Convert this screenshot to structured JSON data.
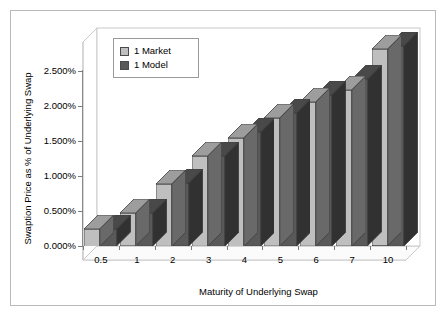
{
  "figure": {
    "border_color": "#b9b9b9",
    "background": "#ffffff"
  },
  "legend": {
    "position": "top-left-inside",
    "entries": [
      {
        "label": "1 Market",
        "color": "#bfbfbf",
        "swatch_name": "legend-swatch-market"
      },
      {
        "label": "1 Model",
        "color": "#595959",
        "swatch_name": "legend-swatch-model"
      }
    ]
  },
  "axes": {
    "y_title": "Swaption Price as % of Underlying Swap",
    "x_title": "Maturity of Underlying Swap",
    "y_ticks": [
      "0.000%",
      "0.500%",
      "1.000%",
      "1.500%",
      "2.000%",
      "2.500%"
    ],
    "x_ticks": [
      "0.5",
      "1",
      "2",
      "3",
      "4",
      "5",
      "6",
      "7",
      "10"
    ]
  },
  "chart_data": {
    "type": "bar",
    "title": "",
    "subtitle": "",
    "xlabel": "Maturity of Underlying Swap",
    "ylabel": "Swaption Price as % of Underlying Swap",
    "categories": [
      "0.5",
      "1",
      "2",
      "3",
      "4",
      "5",
      "6",
      "7",
      "10"
    ],
    "series": [
      {
        "name": "1 Market",
        "color": "#bfbfbf",
        "values": [
          0.25,
          0.47,
          0.89,
          1.29,
          1.55,
          1.83,
          2.06,
          2.23,
          2.81
        ]
      },
      {
        "name": "1 Model",
        "color": "#595959",
        "values": [
          0.24,
          0.47,
          0.9,
          1.29,
          1.63,
          1.9,
          2.16,
          2.38,
          2.86
        ]
      }
    ],
    "ylim": [
      0,
      2.75
    ],
    "ytick_values": [
      0,
      0.5,
      1.0,
      1.5,
      2.0,
      2.5
    ],
    "ytick_suffix": "%",
    "grid": false,
    "legend_position": "upper left",
    "three_d": true,
    "value_unit": "percent"
  }
}
